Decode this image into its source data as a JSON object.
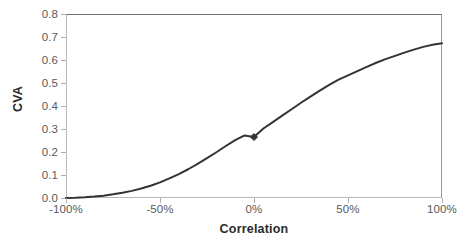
{
  "chart_data": {
    "type": "line",
    "title": "",
    "xlabel": "Correlation",
    "ylabel": "CVA",
    "xlim": [
      -100,
      100
    ],
    "ylim": [
      0.0,
      0.8
    ],
    "grid": false,
    "legend": null,
    "x_tick_labels": [
      "-100%",
      "-50%",
      "0%",
      "50%",
      "100%"
    ],
    "x_tick_values": [
      -100,
      -50,
      0,
      50,
      100
    ],
    "y_tick_labels": [
      "0.0",
      "0.1",
      "0.2",
      "0.3",
      "0.4",
      "0.5",
      "0.6",
      "0.7",
      "0.8"
    ],
    "y_tick_values": [
      0.0,
      0.1,
      0.2,
      0.3,
      0.4,
      0.5,
      0.6,
      0.7,
      0.8
    ],
    "series": [
      {
        "name": "CVA",
        "color": "#333333",
        "line_width": 2,
        "x": [
          -100,
          -95,
          -90,
          -85,
          -80,
          -75,
          -70,
          -65,
          -60,
          -55,
          -50,
          -45,
          -40,
          -35,
          -30,
          -25,
          -20,
          -15,
          -10,
          -5,
          0,
          5,
          10,
          15,
          20,
          25,
          30,
          35,
          40,
          45,
          50,
          55,
          60,
          65,
          70,
          75,
          80,
          85,
          90,
          95,
          100
        ],
        "values": [
          0.0,
          0.001,
          0.003,
          0.006,
          0.01,
          0.016,
          0.023,
          0.031,
          0.041,
          0.053,
          0.068,
          0.085,
          0.104,
          0.125,
          0.148,
          0.173,
          0.199,
          0.226,
          0.252,
          0.272,
          0.265,
          0.302,
          0.33,
          0.358,
          0.386,
          0.414,
          0.441,
          0.467,
          0.492,
          0.515,
          0.533,
          0.552,
          0.57,
          0.588,
          0.604,
          0.618,
          0.632,
          0.645,
          0.657,
          0.666,
          0.673
        ]
      }
    ],
    "markers": [
      {
        "name": "highlight-point",
        "shape": "diamond",
        "x": 0,
        "y": 0.265,
        "color": "#333333",
        "size": 7
      }
    ]
  }
}
